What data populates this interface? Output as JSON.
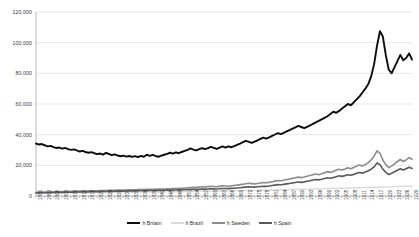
{
  "chart_data": {
    "type": "line",
    "title": "",
    "xlabel": "",
    "ylabel": "",
    "ylim": [
      0,
      120000
    ],
    "xlim": [
      1800,
      1929
    ],
    "grid": true,
    "legend_position": "bottom",
    "ytick_labels": [
      "120,000",
      "100,000",
      "80,000",
      "60,000",
      "40,000",
      "20,000",
      "0"
    ],
    "ytick_values": [
      120000,
      100000,
      80000,
      60000,
      40000,
      20000,
      0
    ],
    "xtick_labels": [
      "1800",
      "1803",
      "1806",
      "1809",
      "1812",
      "1815",
      "1818",
      "1821",
      "1824",
      "1827",
      "1830",
      "1833",
      "1836",
      "1839",
      "1842",
      "1845",
      "1848",
      "1851",
      "1854",
      "1857",
      "1860",
      "1863",
      "1866",
      "1869",
      "1872",
      "1875",
      "1878",
      "1881",
      "1884",
      "1887",
      "1890",
      "1893",
      "1896",
      "1899",
      "1902",
      "1905",
      "1908",
      "1911",
      "1914",
      "1917",
      "1920",
      "1923",
      "1926",
      "1929"
    ],
    "x": [
      1800,
      1801,
      1802,
      1803,
      1804,
      1805,
      1806,
      1807,
      1808,
      1809,
      1810,
      1811,
      1812,
      1813,
      1814,
      1815,
      1816,
      1817,
      1818,
      1819,
      1820,
      1821,
      1822,
      1823,
      1824,
      1825,
      1826,
      1827,
      1828,
      1829,
      1830,
      1831,
      1832,
      1833,
      1834,
      1835,
      1836,
      1837,
      1838,
      1839,
      1840,
      1841,
      1842,
      1843,
      1844,
      1845,
      1846,
      1847,
      1848,
      1849,
      1850,
      1851,
      1852,
      1853,
      1854,
      1855,
      1856,
      1857,
      1858,
      1859,
      1860,
      1861,
      1862,
      1863,
      1864,
      1865,
      1866,
      1867,
      1868,
      1869,
      1870,
      1871,
      1872,
      1873,
      1874,
      1875,
      1876,
      1877,
      1878,
      1879,
      1880,
      1881,
      1882,
      1883,
      1884,
      1885,
      1886,
      1887,
      1888,
      1889,
      1890,
      1891,
      1892,
      1893,
      1894,
      1895,
      1896,
      1897,
      1898,
      1899,
      1900,
      1901,
      1902,
      1903,
      1904,
      1905,
      1906,
      1907,
      1908,
      1909,
      1910,
      1911,
      1912,
      1913,
      1914,
      1915,
      1916,
      1917,
      1918,
      1919,
      1920,
      1921,
      1922,
      1923,
      1924,
      1925,
      1926,
      1927,
      1928,
      1929
    ],
    "series": [
      {
        "name": "Britain",
        "color": "#0d0d0d",
        "width": 1.9,
        "values": [
          34200,
          33600,
          33900,
          33100,
          32400,
          32700,
          31900,
          31300,
          31600,
          30900,
          31400,
          30600,
          30100,
          30400,
          29700,
          29000,
          29400,
          28700,
          28200,
          28600,
          27900,
          27300,
          27700,
          27000,
          28100,
          27400,
          26600,
          27200,
          26400,
          25900,
          26300,
          25700,
          26100,
          25500,
          26000,
          25300,
          26200,
          25600,
          26900,
          26200,
          26800,
          26100,
          25600,
          26300,
          26900,
          27500,
          28200,
          27600,
          28400,
          27900,
          28700,
          29400,
          30100,
          31000,
          30300,
          29700,
          30500,
          31300,
          30500,
          31200,
          32000,
          31400,
          30700,
          31500,
          32300,
          31600,
          32400,
          31800,
          32600,
          33400,
          34200,
          35100,
          36000,
          35300,
          34600,
          35400,
          36300,
          37200,
          38100,
          37400,
          38300,
          39200,
          40100,
          41000,
          40300,
          41200,
          42100,
          43000,
          43900,
          44800,
          45700,
          45000,
          44200,
          45100,
          46000,
          47000,
          48000,
          49000,
          50000,
          51000,
          52000,
          53500,
          55000,
          54200,
          55500,
          57000,
          58500,
          60000,
          59200,
          61000,
          63000,
          65000,
          67500,
          70000,
          73000,
          78000,
          86000,
          98000,
          107500,
          104000,
          92000,
          82500,
          80000,
          84000,
          88000,
          92000,
          88500,
          90000,
          93000,
          89000
        ]
      },
      {
        "name": "Brazil",
        "color": "#d9d9d9",
        "width": 1.4,
        "values": [
          1800,
          1830,
          1850,
          1870,
          1890,
          1910,
          1930,
          1950,
          1970,
          1990,
          2010,
          2030,
          2050,
          2070,
          2090,
          2110,
          2130,
          2150,
          2170,
          2190,
          2210,
          2230,
          2250,
          2270,
          2290,
          2310,
          2330,
          2350,
          2370,
          2390,
          2410,
          2430,
          2450,
          2470,
          2490,
          2510,
          2530,
          2550,
          2570,
          2590,
          2610,
          2630,
          2650,
          2670,
          2690,
          2710,
          2730,
          2760,
          2790,
          2820,
          2850,
          2880,
          2910,
          2940,
          2970,
          3000,
          3030,
          3060,
          3090,
          3120,
          3150,
          3180,
          3210,
          3240,
          3270,
          3300,
          3330,
          3360,
          3390,
          3420,
          3450,
          3490,
          3530,
          3570,
          3610,
          3650,
          3690,
          3730,
          3770,
          3810,
          3850,
          3900,
          3950,
          4000,
          4050,
          4100,
          4150,
          4200,
          4250,
          4300,
          4350,
          4400,
          4450,
          4500,
          4550,
          4600,
          4650,
          4700,
          4750,
          4800,
          4850,
          4900,
          4950,
          5000,
          5050,
          5100,
          5150,
          5200,
          5250,
          5300,
          5350,
          5400,
          5450,
          5500,
          5560,
          5620,
          5680,
          5740,
          5800,
          5860,
          5920,
          5980,
          6040,
          6100,
          6160,
          6220,
          6280,
          6340,
          6400,
          6450
        ]
      },
      {
        "name": "Sweden",
        "color": "#8c8c8c",
        "width": 1.6,
        "values": [
          2400,
          2450,
          2500,
          2550,
          2600,
          2650,
          2700,
          2750,
          2800,
          2850,
          2900,
          2950,
          3000,
          3050,
          3100,
          3150,
          3200,
          3250,
          3300,
          3350,
          3400,
          3450,
          3500,
          3550,
          3600,
          3650,
          3700,
          3750,
          3800,
          3850,
          3900,
          3950,
          4000,
          4050,
          4100,
          4150,
          4200,
          4250,
          4300,
          4350,
          4400,
          4450,
          4500,
          4550,
          4600,
          4650,
          4700,
          4800,
          4900,
          5000,
          5100,
          5250,
          5400,
          5550,
          5700,
          5600,
          5800,
          6000,
          5900,
          6100,
          6300,
          6200,
          6000,
          6300,
          6600,
          6500,
          6400,
          6600,
          6900,
          7100,
          7400,
          7700,
          8000,
          8300,
          8100,
          7900,
          8200,
          8500,
          8800,
          8600,
          8900,
          9300,
          9700,
          10100,
          9900,
          10300,
          10700,
          11100,
          11500,
          11900,
          12300,
          12000,
          12400,
          12900,
          13400,
          13900,
          14400,
          13900,
          14500,
          15200,
          15900,
          15400,
          16000,
          16800,
          17500,
          16900,
          17600,
          18400,
          17800,
          18600,
          19500,
          20200,
          19600,
          20500,
          21800,
          23500,
          26000,
          29500,
          28000,
          23500,
          20500,
          18500,
          19500,
          21000,
          22500,
          23800,
          22500,
          23500,
          25000,
          24000
        ]
      },
      {
        "name": "Spain",
        "color": "#595959",
        "width": 1.6,
        "values": [
          2000,
          2040,
          2080,
          2120,
          2160,
          2200,
          2240,
          2280,
          2320,
          2360,
          2400,
          2440,
          2480,
          2520,
          2560,
          2600,
          2640,
          2680,
          2720,
          2760,
          2800,
          2840,
          2880,
          2920,
          2960,
          3000,
          3040,
          3080,
          3120,
          3160,
          3200,
          3240,
          3280,
          3320,
          3360,
          3400,
          3440,
          3480,
          3520,
          3560,
          3600,
          3640,
          3680,
          3720,
          3760,
          3800,
          3840,
          3900,
          3960,
          4020,
          4080,
          4160,
          4240,
          4320,
          4400,
          4350,
          4450,
          4550,
          4500,
          4600,
          4700,
          4650,
          4550,
          4700,
          4900,
          4850,
          4800,
          4950,
          5100,
          5250,
          5400,
          5600,
          5800,
          6000,
          5900,
          5800,
          6000,
          6200,
          6400,
          6300,
          6500,
          6800,
          7100,
          7400,
          7300,
          7600,
          7900,
          8200,
          8500,
          8800,
          9100,
          8900,
          9200,
          9600,
          10000,
          10400,
          10800,
          10500,
          10900,
          11400,
          11900,
          11600,
          12000,
          12600,
          13200,
          12800,
          13300,
          13900,
          13500,
          14100,
          14800,
          15300,
          14900,
          15600,
          16500,
          17500,
          19000,
          21500,
          20500,
          17500,
          15500,
          14000,
          14800,
          15800,
          16800,
          17800,
          17000,
          17800,
          18800,
          18000
        ]
      }
    ]
  },
  "legend": {
    "items": [
      {
        "label": "h Britain",
        "color": "#0d0d0d"
      },
      {
        "label": "h Brazil",
        "color": "#d9d9d9"
      },
      {
        "label": "h Sweden",
        "color": "#8c8c8c"
      },
      {
        "label": "h Spain",
        "color": "#595959"
      }
    ]
  },
  "axes": {
    "gridline_color": "#d6d6d6",
    "axis_color": "#9a9a9a",
    "tick_color": "#8a8a8a"
  }
}
